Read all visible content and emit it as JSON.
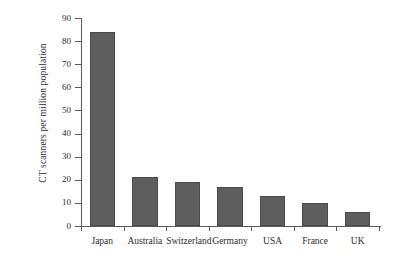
{
  "chart_data": {
    "type": "bar",
    "title": "",
    "xlabel": "",
    "ylabel": "CT scanners per million population",
    "categories": [
      "Japan",
      "Australia",
      "Switzerland",
      "Germany",
      "USA",
      "France",
      "UK"
    ],
    "values": [
      84,
      21,
      19,
      17,
      13,
      10,
      6
    ],
    "ylim": [
      0,
      90
    ],
    "yticks": [
      0,
      10,
      20,
      30,
      40,
      50,
      60,
      70,
      80,
      90
    ],
    "ytick_labels": [
      "0",
      "10",
      "20",
      "30",
      "40",
      "50",
      "60",
      "70",
      "80",
      "90"
    ],
    "grid": false,
    "legend": false,
    "bar_color": "#5e5e5e",
    "bar_edge_color": "#4a4a4a",
    "axis_color": "#5a5a5a",
    "background_color": "#ffffff"
  }
}
